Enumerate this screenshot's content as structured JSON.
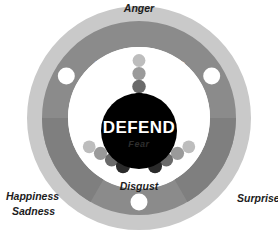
{
  "canvas": {
    "width": 278,
    "height": 236,
    "background": "#ffffff"
  },
  "colors": {
    "outer_ring": "#c9c9c9",
    "inner_ring": "#8b8b8b",
    "inner_ring_dark": "#7d7d7d",
    "core": "#000000",
    "node": "#ffffff",
    "label_text": "#1c1c1c",
    "ring_label_text": "#ffffff",
    "core_label_text": "#ffffff",
    "core_sublabel_text": "#2e2e2e"
  },
  "core": {
    "label": "DEFEND",
    "sublabel": "Fear"
  },
  "ring_segments": [
    {
      "label": "ACQUIRE",
      "position": "top"
    },
    {
      "label": "BOND",
      "position": "lower-left"
    },
    {
      "label": "LEARN",
      "position": "lower-right"
    }
  ],
  "external_labels": [
    {
      "text": "Anger",
      "position": "top"
    },
    {
      "text": "Surprise",
      "position": "right"
    },
    {
      "text": "Happiness",
      "position": "lower-left"
    },
    {
      "text": "Sadness",
      "position": "lower-left-second"
    },
    {
      "text": "Disgust",
      "position": "bottom-inner"
    }
  ],
  "nodes": [
    {
      "name": "node-upper-left",
      "angle_oclock": 10
    },
    {
      "name": "node-upper-right",
      "angle_oclock": 2
    },
    {
      "name": "node-bottom",
      "angle_oclock": 6
    }
  ],
  "dot_chains": [
    {
      "name": "chain-top",
      "direction": "12-oclock",
      "dot_colors": [
        "#bdbdbd",
        "#9a9a9a",
        "#6a6a6a",
        "#2a2a2a"
      ]
    },
    {
      "name": "chain-lower-left",
      "direction": "8-oclock",
      "dot_colors": [
        "#bdbdbd",
        "#9a9a9a",
        "#6a6a6a",
        "#2a2a2a"
      ]
    },
    {
      "name": "chain-lower-right",
      "direction": "4-oclock",
      "dot_colors": [
        "#bdbdbd",
        "#9a9a9a",
        "#6a6a6a",
        "#2a2a2a"
      ]
    }
  ]
}
